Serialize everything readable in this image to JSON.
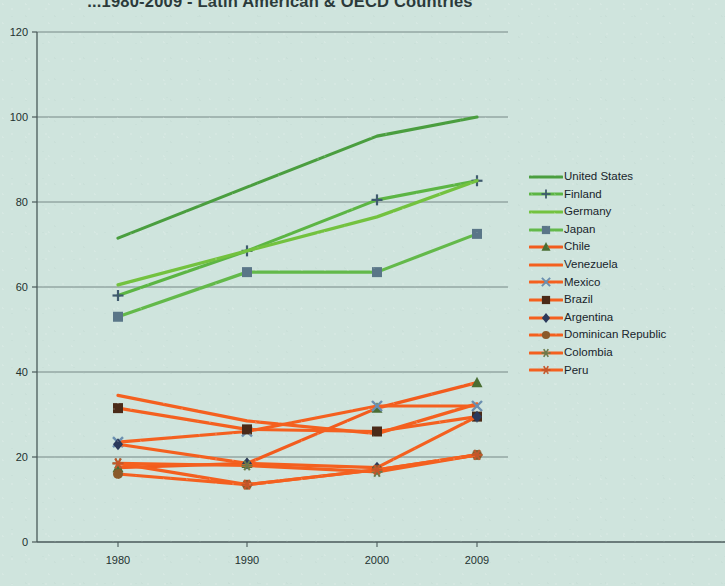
{
  "chart_data": {
    "type": "line",
    "title": "...1980-2009 - Latin American & OECD Countries",
    "xlabel": "",
    "ylabel": "",
    "x": [
      1980,
      1990,
      2000,
      2009
    ],
    "xtick_labels": [
      "1980",
      "1990",
      "2000",
      "2009"
    ],
    "ytick_labels": [
      "0",
      "20",
      "40",
      "60",
      "80",
      "100",
      "120"
    ],
    "ylim": [
      0,
      120
    ],
    "ytick_step": 20,
    "grid": "horizontal",
    "legend_position": "right",
    "series": [
      {
        "name": "United States",
        "values": [
          71.5,
          83.5,
          95.5,
          100.0
        ],
        "color": "#4a9e3f",
        "marker": "none",
        "marker_color": "#2f6f28"
      },
      {
        "name": "Finland",
        "values": [
          58.0,
          68.5,
          80.5,
          85.0
        ],
        "color": "#5cb544",
        "marker": "plus",
        "marker_color": "#3f5a6e"
      },
      {
        "name": "Germany",
        "values": [
          60.5,
          68.5,
          76.5,
          85.0
        ],
        "color": "#73c23f",
        "marker": "none",
        "marker_color": "#6b4a2a"
      },
      {
        "name": "Japan",
        "values": [
          53.0,
          63.5,
          63.5,
          72.5
        ],
        "color": "#63b94a",
        "marker": "square",
        "marker_color": "#5a7688"
      },
      {
        "name": "Chile",
        "values": [
          17.5,
          18.5,
          31.5,
          37.5
        ],
        "color": "#f25c1e",
        "marker": "triangle",
        "marker_color": "#4a6e33"
      },
      {
        "name": "Venezuela",
        "values": [
          34.5,
          28.5,
          25.5,
          32.5
        ],
        "color": "#f4601f",
        "marker": "none",
        "marker_color": "#e07838"
      },
      {
        "name": "Mexico",
        "values": [
          23.5,
          26.0,
          32.0,
          32.0
        ],
        "color": "#f4601f",
        "marker": "x",
        "marker_color": "#6b8fb0"
      },
      {
        "name": "Brazil",
        "values": [
          31.5,
          26.5,
          26.0,
          29.5
        ],
        "color": "#f4601f",
        "marker": "sq-dark",
        "marker_color": "#4a2a18"
      },
      {
        "name": "Argentina",
        "values": [
          23.0,
          18.5,
          17.5,
          29.5
        ],
        "color": "#f4601f",
        "marker": "diamond",
        "marker_color": "#2b3a5c"
      },
      {
        "name": "Dominican Republic",
        "values": [
          16.0,
          13.5,
          17.0,
          20.5
        ],
        "color": "#f4601f",
        "marker": "circle",
        "marker_color": "#8a5a2a"
      },
      {
        "name": "Colombia",
        "values": [
          18.5,
          18.0,
          16.5,
          20.5
        ],
        "color": "#f4601f",
        "marker": "asterisk",
        "marker_color": "#6b7a4a"
      },
      {
        "name": "Peru",
        "values": [
          18.5,
          13.5,
          17.0,
          20.5
        ],
        "color": "#f4601f",
        "marker": "star",
        "marker_color": "#c4562a"
      }
    ]
  },
  "colors": {
    "background": "#cfe4dd",
    "axis": "#4a5a5a",
    "grid": "#5a6a6a",
    "oecd_green": "#5cb544",
    "latam_orange": "#f4601f"
  }
}
